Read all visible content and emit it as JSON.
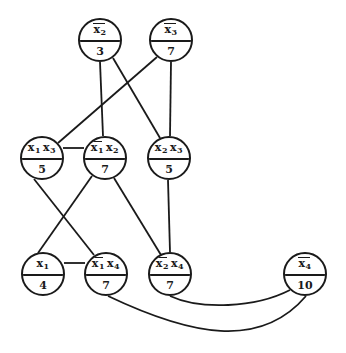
{
  "diagram": {
    "type": "weighted-graph",
    "nodes": [
      {
        "id": "n_x2bar",
        "literals": [
          {
            "var": "x",
            "sub": "2",
            "neg": true
          }
        ],
        "label": "x̄2",
        "weight": "3",
        "cx": 100,
        "cy": 40
      },
      {
        "id": "n_x3bar",
        "literals": [
          {
            "var": "x",
            "sub": "3",
            "neg": true
          }
        ],
        "label": "x̄3",
        "weight": "7",
        "cx": 171,
        "cy": 40
      },
      {
        "id": "n_x1x3",
        "literals": [
          {
            "var": "x",
            "sub": "1",
            "neg": false
          },
          {
            "var": "x",
            "sub": "3",
            "neg": false
          }
        ],
        "label": "x1 x3",
        "weight": "5",
        "cx": 42,
        "cy": 158
      },
      {
        "id": "n_x1barx2",
        "literals": [
          {
            "var": "x",
            "sub": "1",
            "neg": true
          },
          {
            "var": "x",
            "sub": "2",
            "neg": false
          }
        ],
        "label": "x̄1 x2",
        "weight": "7",
        "cx": 105,
        "cy": 158
      },
      {
        "id": "n_x2x3",
        "literals": [
          {
            "var": "x",
            "sub": "2",
            "neg": false
          },
          {
            "var": "x",
            "sub": "3",
            "neg": false
          }
        ],
        "label": "x2 x3",
        "weight": "5",
        "cx": 169,
        "cy": 158
      },
      {
        "id": "n_x1",
        "literals": [
          {
            "var": "x",
            "sub": "1",
            "neg": false
          }
        ],
        "label": "x1",
        "weight": "4",
        "cx": 43,
        "cy": 274
      },
      {
        "id": "n_x1barx4",
        "literals": [
          {
            "var": "x",
            "sub": "1",
            "neg": true
          },
          {
            "var": "x",
            "sub": "4",
            "neg": false
          }
        ],
        "label": "x̄1 x4",
        "weight": "7",
        "cx": 106,
        "cy": 274
      },
      {
        "id": "n_x2barx4",
        "literals": [
          {
            "var": "x",
            "sub": "2",
            "neg": true
          },
          {
            "var": "x",
            "sub": "4",
            "neg": false
          }
        ],
        "label": "x̄2 x4",
        "weight": "7",
        "cx": 170,
        "cy": 274
      },
      {
        "id": "n_x4bar",
        "literals": [
          {
            "var": "x",
            "sub": "4",
            "neg": true
          }
        ],
        "label": "x̄4",
        "weight": "10",
        "cx": 305,
        "cy": 274
      }
    ],
    "edges": [
      {
        "from": "n_x2bar",
        "to": "n_x1barx2",
        "d": "M100 62 L103 136"
      },
      {
        "from": "n_x2bar",
        "to": "n_x2x3",
        "d": "M113 58 L160 138"
      },
      {
        "from": "n_x3bar",
        "to": "n_x1x3",
        "d": "M157 57 L58 143"
      },
      {
        "from": "n_x3bar",
        "to": "n_x2x3",
        "d": "M171 62 L170 136"
      },
      {
        "from": "n_x1x3",
        "to": "n_x1barx2",
        "d": "M63 148 L84 148"
      },
      {
        "from": "n_x1x3",
        "to": "n_x1barx4",
        "d": "M34 179 L94 255"
      },
      {
        "from": "n_x1barx2",
        "to": "n_x1",
        "d": "M92 176 L38 253"
      },
      {
        "from": "n_x1barx2",
        "to": "n_x2barx4",
        "d": "M114 178 L161 255"
      },
      {
        "from": "n_x2x3",
        "to": "n_x2barx4",
        "d": "M168 180 L170 252"
      },
      {
        "from": "n_x1",
        "to": "n_x1barx4",
        "d": "M64 263 L85 263"
      },
      {
        "from": "n_x2barx4",
        "to": "n_x4bar",
        "d": "M170 296 C 200 310, 255 308, 290 290"
      },
      {
        "from": "n_x1barx4",
        "to": "n_x4bar",
        "d": "M108 296 C 190 335, 260 350, 306 296"
      }
    ],
    "colors": {
      "stroke": "#1a1a1a",
      "background": "#ffffff"
    }
  }
}
